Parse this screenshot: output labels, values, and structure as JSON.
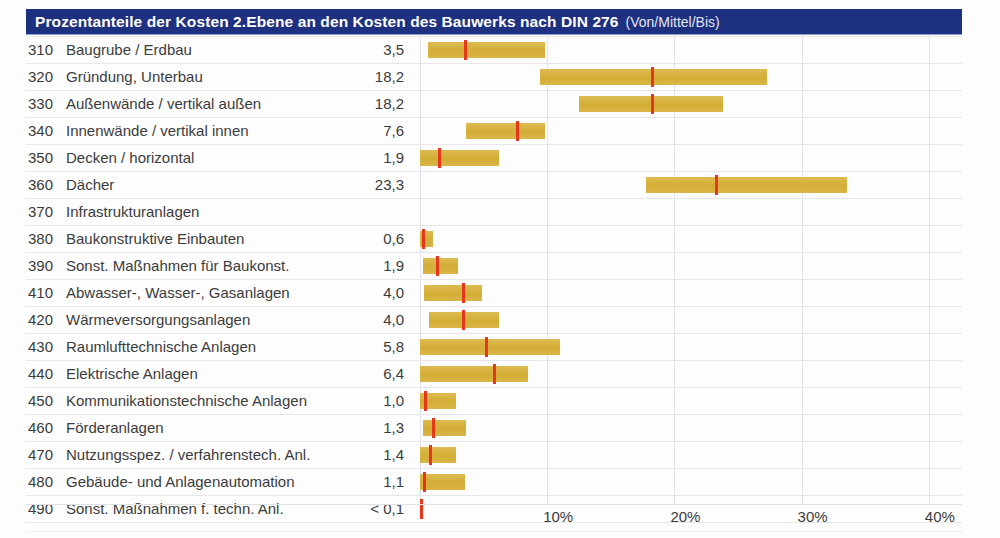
{
  "header": {
    "title_main": "Prozentanteile der Kosten 2.Ebene an den Kosten des Bauwerks nach DIN 276",
    "title_sub": "(Von/Mittel/Bis)",
    "bg_color": "#1e3080",
    "text_color": "#ffffff"
  },
  "colors": {
    "bar": "#d8b544",
    "marker": "#e8361c",
    "grid": "#dfe3ee",
    "row_rule": "#e7e7e7",
    "text": "#3c3c3c"
  },
  "chart_data": {
    "type": "bar",
    "title": "Prozentanteile der Kosten 2.Ebene an den Kosten des Bauwerks nach DIN 276",
    "subtitle": "(Von/Mittel/Bis)",
    "xlabel": "",
    "ylabel": "",
    "xlim": [
      0,
      43
    ],
    "grid": true,
    "legend": "none",
    "orientation": "horizontal",
    "value_column_header": "Mittel",
    "xticks": [
      {
        "value": 10,
        "label": "10%"
      },
      {
        "value": 20,
        "label": "20%"
      },
      {
        "value": 30,
        "label": "30%"
      },
      {
        "value": 40,
        "label": "40%"
      }
    ],
    "categories": [
      {
        "code": "310",
        "label": "Baugrube / Erdbau",
        "value_text": "3,5",
        "von": 0.6,
        "mittel": 3.5,
        "bis": 9.8
      },
      {
        "code": "320",
        "label": "Gründung, Unterbau",
        "value_text": "18,2",
        "von": 9.4,
        "mittel": 18.2,
        "bis": 27.3
      },
      {
        "code": "330",
        "label": "Außenwände / vertikal außen",
        "value_text": "18,2",
        "von": 12.5,
        "mittel": 18.2,
        "bis": 23.8
      },
      {
        "code": "340",
        "label": "Innenwände / vertikal innen",
        "value_text": "7,6",
        "von": 3.6,
        "mittel": 7.6,
        "bis": 9.8
      },
      {
        "code": "350",
        "label": "Decken / horizontal",
        "value_text": "1,9",
        "von": 0.0,
        "mittel": 1.5,
        "bis": 6.2
      },
      {
        "code": "360",
        "label": "Dächer",
        "value_text": "23,3",
        "von": 17.8,
        "mittel": 23.3,
        "bis": 33.6
      },
      {
        "code": "370",
        "label": "Infrastrukturanlagen",
        "value_text": "",
        "von": null,
        "mittel": null,
        "bis": null
      },
      {
        "code": "380",
        "label": "Baukonstruktive Einbauten",
        "value_text": "0,6",
        "von": 0.0,
        "mittel": 0.2,
        "bis": 1.0
      },
      {
        "code": "390",
        "label": "Sonst. Maßnahmen für Baukonst.",
        "value_text": "1,9",
        "von": 0.2,
        "mittel": 1.3,
        "bis": 3.0
      },
      {
        "code": "410",
        "label": "Abwasser-, Wasser-, Gasanlagen",
        "value_text": "4,0",
        "von": 0.3,
        "mittel": 3.4,
        "bis": 4.9
      },
      {
        "code": "420",
        "label": "Wärmeversorgungsanlagen",
        "value_text": "4,0",
        "von": 0.7,
        "mittel": 3.4,
        "bis": 6.2
      },
      {
        "code": "430",
        "label": "Raumlufttechnische Anlagen",
        "value_text": "5,8",
        "von": 0.0,
        "mittel": 5.2,
        "bis": 11.0
      },
      {
        "code": "440",
        "label": "Elektrische Anlagen",
        "value_text": "6,4",
        "von": 0.0,
        "mittel": 5.8,
        "bis": 8.5
      },
      {
        "code": "450",
        "label": "Kommunikationstechnische Anlagen",
        "value_text": "1,0",
        "von": 0.0,
        "mittel": 0.4,
        "bis": 2.8
      },
      {
        "code": "460",
        "label": "Förderanlagen",
        "value_text": "1,3",
        "von": 0.2,
        "mittel": 1.0,
        "bis": 3.6
      },
      {
        "code": "470",
        "label": "Nutzungsspez. / verfahrenstech. Anl.",
        "value_text": "1,4",
        "von": 0.0,
        "mittel": 0.8,
        "bis": 2.8
      },
      {
        "code": "480",
        "label": "Gebäude- und Anlagenautomation",
        "value_text": "1,1",
        "von": 0.0,
        "mittel": 0.3,
        "bis": 3.5
      },
      {
        "code": "490",
        "label": "Sonst. Maßnahmen f. techn. Anl.",
        "value_text": "< 0,1",
        "von": 0.0,
        "mittel": 0.05,
        "bis": 0.1
      }
    ]
  }
}
